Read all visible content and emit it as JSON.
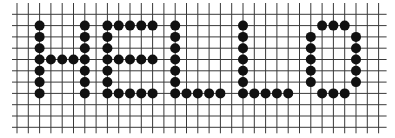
{
  "grid": {
    "origin_x": 17,
    "origin_y": 3,
    "cell": 11.3,
    "cols": 33,
    "rows": 12,
    "line_color": "#3a3a3a",
    "dot_color": "#111111",
    "dot_radius": 5
  },
  "letters": [
    {
      "char": "H",
      "dots": [
        [
          2,
          2
        ],
        [
          2,
          3
        ],
        [
          2,
          4
        ],
        [
          2,
          5
        ],
        [
          2,
          6
        ],
        [
          2,
          7
        ],
        [
          2,
          8
        ],
        [
          6,
          2
        ],
        [
          6,
          3
        ],
        [
          6,
          4
        ],
        [
          6,
          5
        ],
        [
          6,
          6
        ],
        [
          6,
          7
        ],
        [
          6,
          8
        ],
        [
          3,
          5
        ],
        [
          4,
          5
        ],
        [
          5,
          5
        ]
      ]
    },
    {
      "char": "E",
      "dots": [
        [
          8,
          2
        ],
        [
          8,
          3
        ],
        [
          8,
          4
        ],
        [
          8,
          5
        ],
        [
          8,
          6
        ],
        [
          8,
          7
        ],
        [
          8,
          8
        ],
        [
          9,
          2
        ],
        [
          10,
          2
        ],
        [
          11,
          2
        ],
        [
          12,
          2
        ],
        [
          9,
          5
        ],
        [
          10,
          5
        ],
        [
          11,
          5
        ],
        [
          12,
          5
        ],
        [
          9,
          8
        ],
        [
          10,
          8
        ],
        [
          11,
          8
        ],
        [
          12,
          8
        ]
      ]
    },
    {
      "char": "L",
      "dots": [
        [
          14,
          2
        ],
        [
          14,
          3
        ],
        [
          14,
          4
        ],
        [
          14,
          5
        ],
        [
          14,
          6
        ],
        [
          14,
          7
        ],
        [
          14,
          8
        ],
        [
          15,
          8
        ],
        [
          16,
          8
        ],
        [
          17,
          8
        ],
        [
          18,
          8
        ]
      ]
    },
    {
      "char": "L",
      "dots": [
        [
          20,
          2
        ],
        [
          20,
          3
        ],
        [
          20,
          4
        ],
        [
          20,
          5
        ],
        [
          20,
          6
        ],
        [
          20,
          7
        ],
        [
          20,
          8
        ],
        [
          21,
          8
        ],
        [
          22,
          8
        ],
        [
          23,
          8
        ],
        [
          24,
          8
        ]
      ]
    },
    {
      "char": "O",
      "dots": [
        [
          27,
          2
        ],
        [
          28,
          2
        ],
        [
          29,
          2
        ],
        [
          26,
          3
        ],
        [
          26,
          4
        ],
        [
          26,
          5
        ],
        [
          26,
          6
        ],
        [
          26,
          7
        ],
        [
          30,
          3
        ],
        [
          30,
          4
        ],
        [
          30,
          5
        ],
        [
          30,
          6
        ],
        [
          30,
          7
        ],
        [
          27,
          8
        ],
        [
          28,
          8
        ],
        [
          29,
          8
        ]
      ]
    }
  ]
}
